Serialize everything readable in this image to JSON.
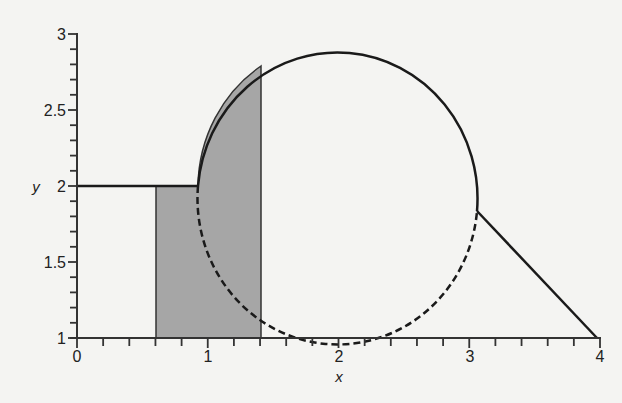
{
  "chart_data": {
    "type": "line",
    "title": "",
    "xlabel": "x",
    "ylabel": "y",
    "xlim": [
      0,
      4
    ],
    "ylim": [
      1,
      3
    ],
    "grid": false,
    "legend": null,
    "x_ticks": [
      "0",
      "1",
      "2",
      "3",
      "4"
    ],
    "y_ticks": [
      "1",
      "1.5",
      "2",
      "2.5",
      "3"
    ],
    "x_minor_step": 0.2,
    "y_minor_step": 0.1,
    "series": [
      {
        "name": "left horizontal segment",
        "style": "solid",
        "points": [
          [
            0,
            2
          ],
          [
            0.93,
            2
          ]
        ]
      },
      {
        "name": "circle upper arc",
        "style": "solid",
        "center": [
          2,
          2
        ],
        "radius": 0.95,
        "from_deg": 180,
        "to_deg": 0,
        "note": "solid from left point (0.93,2) over top to right point near (3.07,1.84)"
      },
      {
        "name": "circle lower arc",
        "style": "dashed",
        "center": [
          2,
          2
        ],
        "radius": 0.95,
        "note": "dashed lower portion from (0.93,2) through (2,1.05) to (3.07,1.84)"
      },
      {
        "name": "right diagonal segment",
        "style": "solid",
        "points": [
          [
            3.07,
            1.84
          ],
          [
            4,
            1
          ]
        ]
      }
    ],
    "shaded_region": {
      "color": "#a6a6a6",
      "x_range": [
        0.6,
        1.4
      ],
      "description": "Region from x=0.6 to x=1.4 under the solid upper boundary (y=2 for x<0.93, then circle upper arc), down to y=1",
      "vertices_approx": [
        [
          0.6,
          1
        ],
        [
          0.6,
          2
        ],
        [
          0.93,
          2
        ],
        [
          1.4,
          2.79
        ],
        [
          1.4,
          1
        ]
      ]
    }
  },
  "axes": {
    "x_label": "x",
    "y_label": "y",
    "x_tick_labels": [
      "0",
      "1",
      "2",
      "3",
      "4"
    ],
    "y_tick_labels": [
      "1",
      "1.5",
      "2",
      "2.5",
      "3"
    ]
  },
  "colors": {
    "background": "#f4f4f2",
    "line": "#1a1a1a",
    "shade": "#a6a6a6"
  }
}
